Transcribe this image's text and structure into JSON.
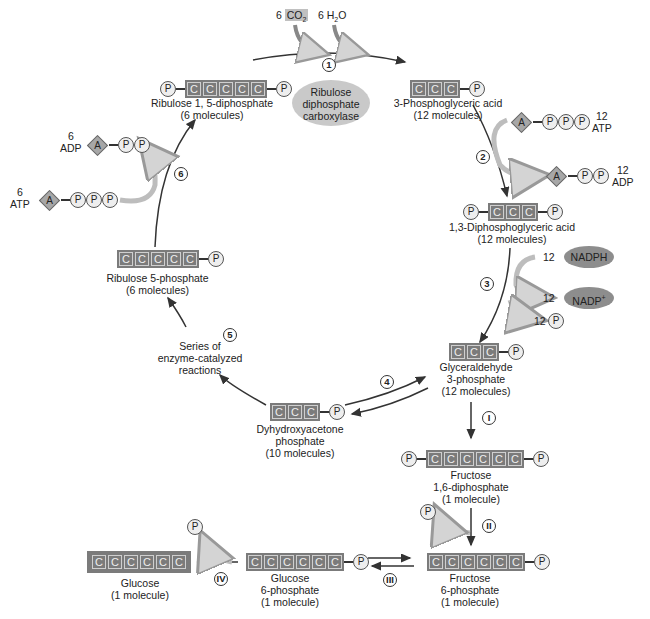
{
  "inputs": {
    "co2": {
      "count": "6",
      "formula": "CO",
      "sub": "2"
    },
    "h2o": {
      "count": "6",
      "formula_pre": "H",
      "sub": "2",
      "formula_post": "O"
    }
  },
  "enzyme": {
    "line1": "Ribulose",
    "line2": "diphosphate",
    "line3": "carboxylase"
  },
  "steps": {
    "s1": "1",
    "s2": "2",
    "s3": "3",
    "s4": "4",
    "s5": "5",
    "s6": "6",
    "r1": "I",
    "r2": "II",
    "r3": "III",
    "r4": "IV"
  },
  "molecules": {
    "rudp": {
      "name": "Ribulose 1, 5-diphosphate",
      "count": "(6 molecules)"
    },
    "pga": {
      "name": "3-Phosphoglyceric acid",
      "count": "(12 molecules)"
    },
    "dpga": {
      "name": "1,3-Diphosphoglyceric acid",
      "count": "(12 molecules)"
    },
    "g3p": {
      "name1": "Glyceraldehyde",
      "name2": "3-phosphate",
      "count": "(12 molecules)"
    },
    "dhap": {
      "name1": "Dyhydroxyacetone",
      "name2": "phosphate",
      "count": "(10 molecules)"
    },
    "ru5p": {
      "name": "Ribulose 5-phosphate",
      "count": "(6 molecules)"
    },
    "series": {
      "line1": "Series of",
      "line2": "enzyme-catalyzed",
      "line3": "reactions"
    },
    "f16dp": {
      "name1": "Fructose",
      "name2": "1,6-diphosphate",
      "count": "(1 molecule)"
    },
    "f6p": {
      "name1": "Fructose",
      "name2": "6-phosphate",
      "count": "(1 molecule)"
    },
    "g6p": {
      "name1": "Glucose",
      "name2": "6-phosphate",
      "count": "(1 molecule)"
    },
    "glucose": {
      "name": "Glucose",
      "count": "(1 molecule)"
    }
  },
  "cofactors": {
    "atp12": {
      "count": "12",
      "label": "ATP"
    },
    "adp12": {
      "count": "12",
      "label": "ADP"
    },
    "nadph": {
      "count": "12",
      "label": "NADPH"
    },
    "nadp": {
      "count": "12",
      "label": "NADP",
      "sup": "+"
    },
    "pi12": {
      "count": "12"
    },
    "atp6": {
      "count": "6",
      "label": "ATP"
    },
    "adp6": {
      "count": "6",
      "label": "ADP"
    }
  },
  "glyphs": {
    "c": "C",
    "p": "P",
    "a": "A"
  },
  "colors": {
    "carbon_box": "#7b7b7b",
    "phosphate": "#eeeeee",
    "enzyme_oval": "#c9c9c9",
    "nadph_oval": "#8d8d8d",
    "arrow": "#333333",
    "side_arrow": "#c8c8c8"
  }
}
